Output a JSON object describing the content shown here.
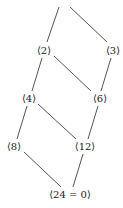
{
  "diagram": {
    "title": "",
    "nodes": [
      {
        "id": "n2",
        "label": "⟨2⟩",
        "x": 44,
        "y": 51
      },
      {
        "id": "n3",
        "label": "⟨3⟩",
        "x": 113,
        "y": 51
      },
      {
        "id": "n4",
        "label": "⟨4⟩",
        "x": 29,
        "y": 99
      },
      {
        "id": "n6",
        "label": "⟨6⟩",
        "x": 100,
        "y": 99
      },
      {
        "id": "n8",
        "label": "⟨8⟩",
        "x": 14,
        "y": 147
      },
      {
        "id": "n12",
        "label": "⟨12⟩",
        "x": 85,
        "y": 147
      },
      {
        "id": "n24",
        "label": "⟨24 = 0⟩",
        "x": 70,
        "y": 195
      }
    ],
    "edges": [
      {
        "from": "top",
        "to": "n2"
      },
      {
        "from": "top",
        "to": "n3"
      },
      {
        "from": "n2",
        "to": "n4"
      },
      {
        "from": "n2",
        "to": "n6"
      },
      {
        "from": "n3",
        "to": "n6"
      },
      {
        "from": "n4",
        "to": "n8"
      },
      {
        "from": "n4",
        "to": "n12"
      },
      {
        "from": "n6",
        "to": "n12"
      },
      {
        "from": "n8",
        "to": "n24"
      },
      {
        "from": "n12",
        "to": "n24"
      }
    ],
    "line_color": "#555555"
  }
}
